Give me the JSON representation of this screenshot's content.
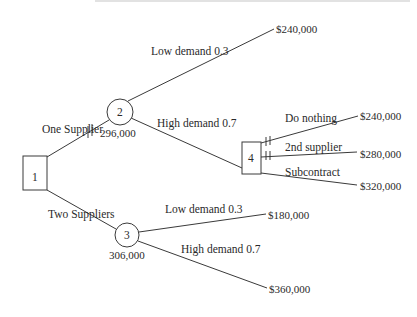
{
  "diagram": {
    "type": "decision-tree",
    "nodes": [
      {
        "id": "1",
        "kind": "decision",
        "label": "1"
      },
      {
        "id": "2",
        "kind": "chance",
        "label": "2",
        "value": "296,000"
      },
      {
        "id": "3",
        "kind": "chance",
        "label": "3",
        "value": "306,000"
      },
      {
        "id": "4",
        "kind": "decision",
        "label": "4"
      }
    ],
    "branches": {
      "one_supplier": "One Supplier",
      "two_suppliers": "Two Suppliers",
      "n2_low": "Low demand 0.3",
      "n2_high": "High demand 0.7",
      "n3_low": "Low demand 0.3",
      "n3_high": "High demand 0.7",
      "do_nothing": "Do nothing",
      "second_supplier": "2nd supplier",
      "subcontract": "Subcontract"
    },
    "payoffs": {
      "n2_low": "$240,000",
      "do_nothing": "$240,000",
      "second_supplier": "$280,000",
      "subcontract": "$320,000",
      "n3_low": "$180,000",
      "n3_high": "$360,000"
    }
  }
}
